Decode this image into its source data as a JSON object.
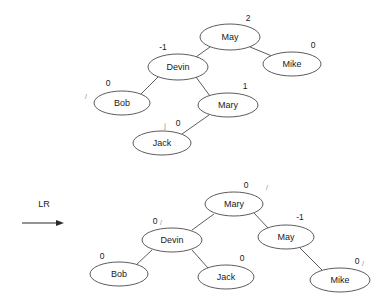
{
  "diagram": {
    "background_color": "#ffffff",
    "stroke_color": "#4a4a4a",
    "text_color": "#1a1a1a",
    "rotation_label": "LR",
    "before_tree": {
      "caption": "",
      "root": "May",
      "nodes": [
        {
          "id": "may-top",
          "label": "May",
          "balance": "2",
          "cx": 230,
          "cy": 37,
          "rx": 30,
          "ry": 13,
          "bx": 248,
          "by": 19
        },
        {
          "id": "devin-top",
          "label": "Devin",
          "balance": "-1",
          "cx": 178,
          "cy": 67,
          "rx": 30,
          "ry": 13,
          "bx": 163,
          "by": 48
        },
        {
          "id": "mike-top",
          "label": "Mike",
          "balance": "0",
          "cx": 292,
          "cy": 64,
          "rx": 29,
          "ry": 12,
          "bx": 313,
          "by": 46
        },
        {
          "id": "bob-top",
          "label": "Bob",
          "balance": "0",
          "cx": 122,
          "cy": 103,
          "rx": 28,
          "ry": 12,
          "bx": 108,
          "by": 84
        },
        {
          "id": "mary-top",
          "label": "Mary",
          "balance": "1",
          "cx": 228,
          "cy": 105,
          "rx": 30,
          "ry": 12,
          "bx": 245,
          "by": 87
        },
        {
          "id": "jack-top",
          "label": "Jack",
          "balance": "0",
          "cx": 162,
          "cy": 143,
          "rx": 29,
          "ry": 12,
          "bx": 178,
          "by": 124
        }
      ],
      "edges": [
        {
          "from": "may-top",
          "to": "devin-top",
          "x1": 210,
          "y1": 47,
          "x2": 196,
          "y2": 57
        },
        {
          "from": "may-top",
          "to": "mike-top",
          "x1": 250,
          "y1": 47,
          "x2": 272,
          "y2": 56
        },
        {
          "from": "devin-top",
          "to": "bob-top",
          "x1": 158,
          "y1": 77,
          "x2": 141,
          "y2": 94
        },
        {
          "from": "devin-top",
          "to": "mary-top",
          "x1": 196,
          "y1": 77,
          "x2": 210,
          "y2": 96
        },
        {
          "from": "mary-top",
          "to": "jack-top",
          "x1": 209,
          "y1": 115,
          "x2": 182,
          "y2": 134
        }
      ],
      "artifacts": [
        {
          "text": "/",
          "x": 86,
          "y": 97
        },
        {
          "text": "j",
          "x": 165,
          "y": 126
        }
      ]
    },
    "after_tree": {
      "caption": "",
      "root": "Mary",
      "nodes": [
        {
          "id": "mary-bot",
          "label": "Mary",
          "balance": "0",
          "cx": 234,
          "cy": 204,
          "rx": 29,
          "ry": 12,
          "bx": 246,
          "by": 186
        },
        {
          "id": "devin-bot",
          "label": "Devin",
          "balance": "0",
          "cx": 172,
          "cy": 240,
          "rx": 30,
          "ry": 12,
          "bx": 155,
          "by": 222
        },
        {
          "id": "may-bot",
          "label": "May",
          "balance": "-1",
          "cx": 286,
          "cy": 237,
          "rx": 28,
          "ry": 12,
          "bx": 300,
          "by": 218
        },
        {
          "id": "bob-bot",
          "label": "Bob",
          "balance": "0",
          "cx": 119,
          "cy": 274,
          "rx": 29,
          "ry": 12,
          "bx": 102,
          "by": 257
        },
        {
          "id": "jack-bot",
          "label": "Jack",
          "balance": "0",
          "cx": 226,
          "cy": 277,
          "rx": 28,
          "ry": 12,
          "bx": 242,
          "by": 259
        },
        {
          "id": "mike-bot",
          "label": "Mike",
          "balance": "0",
          "cx": 340,
          "cy": 280,
          "rx": 30,
          "ry": 12,
          "bx": 357,
          "by": 262
        }
      ],
      "edges": [
        {
          "from": "mary-bot",
          "to": "devin-bot",
          "x1": 214,
          "y1": 214,
          "x2": 192,
          "y2": 230
        },
        {
          "from": "mary-bot",
          "to": "may-bot",
          "x1": 254,
          "y1": 213,
          "x2": 268,
          "y2": 228
        },
        {
          "from": "devin-bot",
          "to": "bob-bot",
          "x1": 152,
          "y1": 250,
          "x2": 136,
          "y2": 265
        },
        {
          "from": "devin-bot",
          "to": "jack-bot",
          "x1": 192,
          "y1": 250,
          "x2": 208,
          "y2": 268
        },
        {
          "from": "may-bot",
          "to": "mike-bot",
          "x1": 300,
          "y1": 248,
          "x2": 322,
          "y2": 270
        }
      ],
      "artifacts": [
        {
          "text": "/",
          "x": 267,
          "y": 188
        },
        {
          "text": "/",
          "x": 161,
          "y": 223
        },
        {
          "text": "/",
          "x": 363,
          "y": 264
        }
      ]
    },
    "arrow": {
      "label": "LR",
      "label_x": 44,
      "label_y": 205,
      "x1": 22,
      "y1": 223,
      "x2": 62,
      "y2": 223
    }
  }
}
